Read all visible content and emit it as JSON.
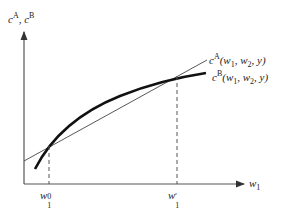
{
  "diagram": {
    "y_axis_label": {
      "base1": "c",
      "sup1": "A",
      "sep": ", ",
      "base2": "c",
      "sup2": "B"
    },
    "x_axis_label": {
      "base": "w",
      "sub": "1"
    },
    "curves": [
      {
        "name": "c^A",
        "label_base": "c",
        "label_sup": "A",
        "label_args": "(w",
        "label_args_sub": "1",
        "label_args_rest": ", w",
        "label_args_sub2": "2",
        "label_args_end": ", y)",
        "style": "thin straight line"
      },
      {
        "name": "c^B",
        "label_base": "c",
        "label_sup": "B",
        "label_args": "(w",
        "label_args_sub": "1",
        "label_args_rest": ", w",
        "label_args_sub2": "2",
        "label_args_end": ", y)",
        "style": "thick concave curve"
      }
    ],
    "ticks": [
      {
        "base": "w",
        "sub": "1",
        "sup": "0"
      },
      {
        "base": "w",
        "sub": "1",
        "sup": "'"
      }
    ],
    "colors": {
      "axis": "#555555",
      "curve": "#111111",
      "line": "#444444"
    }
  }
}
